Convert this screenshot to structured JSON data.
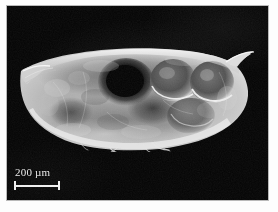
{
  "figure": {
    "kind": "light-micrograph",
    "background_color": "#030303",
    "frame_color": "#b9b9b9",
    "page_color": "#fdfdfd"
  },
  "scale_bar": {
    "label": "200 µm",
    "value": "200",
    "unit": "µm",
    "bar_length_px": "46",
    "color": "#efefef",
    "position": "bottom-left"
  },
  "specimen": {
    "name": "specimen-outline",
    "tissue_light": "#d9d9d9",
    "tissue_mid": "#9a9a9a",
    "tissue_dark": "#1d1d1d",
    "features": [
      {
        "name": "rostrum",
        "label": "rostrum"
      },
      {
        "name": "dorsal-spine",
        "label": "posterior spine"
      },
      {
        "name": "dark-organ",
        "label": "dark central organ"
      },
      {
        "name": "embryo-1",
        "label": "embryo"
      },
      {
        "name": "embryo-2",
        "label": "embryo"
      },
      {
        "name": "embryo-3",
        "label": "embryo"
      },
      {
        "name": "setae",
        "label": "ventral setae"
      }
    ]
  }
}
